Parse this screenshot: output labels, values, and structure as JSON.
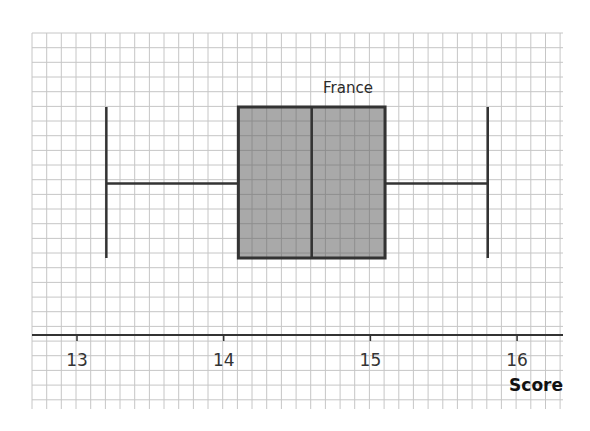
{
  "chart_data": {
    "type": "boxplot",
    "title": "",
    "xlabel": "Score",
    "ylabel": "",
    "xlim": [
      12.7,
      16.32
    ],
    "x_ticks": [
      13,
      14,
      15,
      16
    ],
    "x_tick_labels": [
      "13",
      "14",
      "15",
      "16"
    ],
    "grid": true,
    "grid_minor_step": 0.1,
    "legend": null,
    "series": [
      {
        "name": "France",
        "min": 13.2,
        "q1": 14.1,
        "median": 14.6,
        "q3": 15.1,
        "max": 15.8,
        "fill": "#a9a9a9"
      }
    ]
  },
  "labels": {
    "series_name": "France",
    "axis_title": "Score",
    "ticks": [
      "13",
      "14",
      "15",
      "16"
    ]
  },
  "colors": {
    "background": "#ffffff",
    "grid_line": "#c6c6c6",
    "box_fill": "#a9a9a9",
    "box_stroke": "#333333",
    "axis": "#333333"
  }
}
